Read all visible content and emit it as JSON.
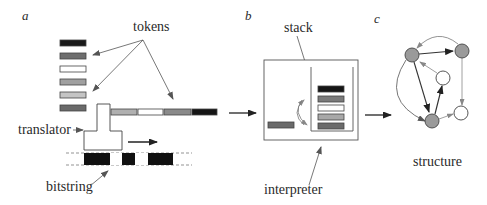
{
  "panels": {
    "a": {
      "label": "a",
      "tokens_label": "tokens",
      "translator_label": "translator",
      "bitstring_label": "bitstring",
      "token_palette": [
        "#1a1a1a",
        "#6e6e6e",
        "#ffffff",
        "#a0a0a0",
        "#c4c4c4",
        "#6a6a6a"
      ],
      "token_row": [
        "#b0b0b0",
        "#ffffff",
        "#8a8a8a",
        "#151515"
      ],
      "bitstring": [
        1,
        1,
        0,
        1,
        0,
        1,
        1
      ]
    },
    "b": {
      "label": "b",
      "stack_label": "stack",
      "interpreter_label": "interpreter",
      "stack_tokens": [
        "#151515",
        "#7a7a7a",
        "#ffffff",
        "#a8a8a8",
        "#6a6a6a"
      ],
      "held_token": "#6a6a6a"
    },
    "c": {
      "label": "c",
      "structure_label": "structure",
      "nodes": [
        {
          "id": "n1",
          "x": 412,
          "y": 55,
          "filled": true
        },
        {
          "id": "n2",
          "x": 462,
          "y": 51,
          "filled": true
        },
        {
          "id": "n3",
          "x": 443,
          "y": 78,
          "filled": false
        },
        {
          "id": "n4",
          "x": 461,
          "y": 114,
          "filled": false
        },
        {
          "id": "n5",
          "x": 432,
          "y": 121,
          "filled": true
        }
      ]
    }
  },
  "colors": {
    "ink": "#2a2a2a",
    "node_fill": "#9a9a9a",
    "arrow_gray": "#6a6a6a"
  }
}
